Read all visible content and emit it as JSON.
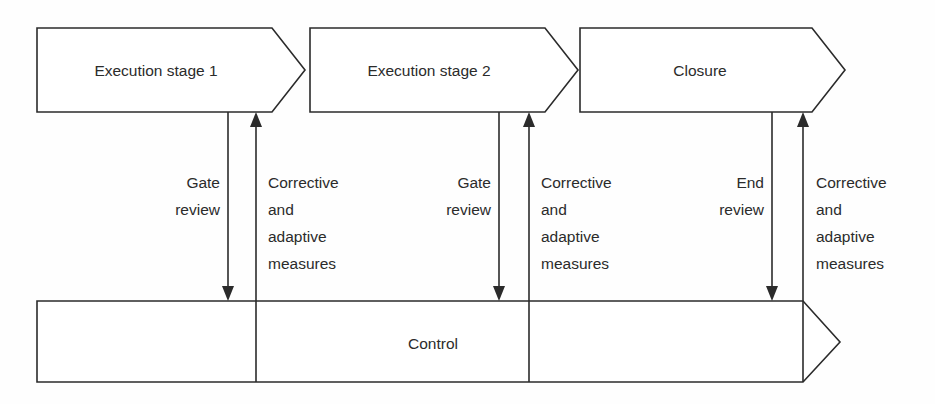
{
  "diagram": {
    "type": "process-flow-chevron",
    "colors": {
      "background": "#fefefe",
      "shape_fill": "#ffffff",
      "line": "#2b2b2b",
      "text": "#2b2b2b"
    },
    "stages": [
      {
        "id": "stage1",
        "label": "Execution stage 1"
      },
      {
        "id": "stage2",
        "label": "Execution stage 2"
      },
      {
        "id": "closure",
        "label": "Closure"
      }
    ],
    "control": {
      "label": "Control"
    },
    "connections": [
      {
        "id": "conn1",
        "down_label_line1": "Gate",
        "down_label_line2": "review",
        "up_label_line1": "Corrective",
        "up_label_line2": "and",
        "up_label_line3": "adaptive",
        "up_label_line4": "measures"
      },
      {
        "id": "conn2",
        "down_label_line1": "Gate",
        "down_label_line2": "review",
        "up_label_line1": "Corrective",
        "up_label_line2": "and",
        "up_label_line3": "adaptive",
        "up_label_line4": "measures"
      },
      {
        "id": "conn3",
        "down_label_line1": "End",
        "down_label_line2": "review",
        "up_label_line1": "Corrective",
        "up_label_line2": "and",
        "up_label_line3": "adaptive",
        "up_label_line4": "measures"
      }
    ]
  }
}
